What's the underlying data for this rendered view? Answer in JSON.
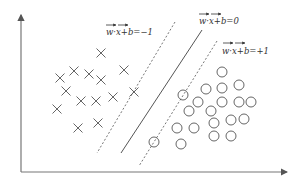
{
  "diagram": {
    "labels": {
      "negative_margin": "w·x+b=−1",
      "decision_boundary": "w·x+b=0",
      "positive_margin": "w·x+b=+1"
    },
    "vector_symbol": "w, x",
    "classes": {
      "negative": {
        "marker": "cross",
        "count": 14
      },
      "positive": {
        "marker": "circle",
        "count": 20
      }
    },
    "colors": {
      "ink": "#555555",
      "axis": "#777777",
      "text": "#333333"
    }
  }
}
